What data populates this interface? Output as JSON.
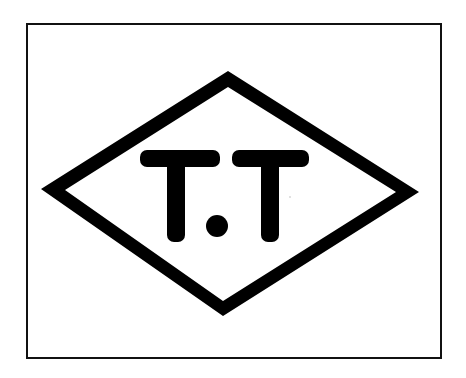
{
  "mark": {
    "text": "T.T",
    "description": "Trademark logo: letters T.T inside a diamond within a rectangular frame",
    "colors": {
      "background": "#ffffff",
      "ink": "#000000",
      "frame": "#111111"
    }
  },
  "frame": {
    "x": 27,
    "y": 24,
    "width": 414,
    "height": 334,
    "stroke_width": 2
  },
  "diamond": {
    "outer": {
      "top": [
        228,
        71
      ],
      "right": [
        419,
        192
      ],
      "bottom": [
        223,
        316
      ],
      "left": [
        41,
        189
      ]
    },
    "inner": {
      "top": [
        228,
        87
      ],
      "right": [
        396,
        192
      ],
      "bottom": [
        223,
        301
      ],
      "left": [
        65,
        190
      ]
    }
  },
  "letters": [
    {
      "char": "T",
      "crossbar": {
        "x": 140,
        "y": 150,
        "width": 80,
        "height": 17
      },
      "stem": {
        "x": 167,
        "y": 150,
        "width": 18,
        "height": 92
      }
    },
    {
      "char": ".",
      "dot": {
        "cx": 217,
        "cy": 226,
        "r": 11
      }
    },
    {
      "char": "T",
      "crossbar": {
        "x": 232,
        "y": 150,
        "width": 77,
        "height": 17
      },
      "stem": {
        "x": 261,
        "y": 150,
        "width": 18,
        "height": 92
      }
    }
  ]
}
